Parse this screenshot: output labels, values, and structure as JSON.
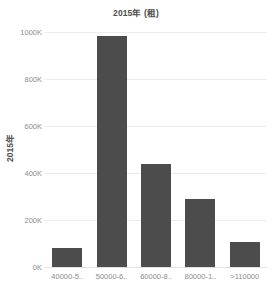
{
  "chart_data": {
    "type": "bar",
    "title": "2015年 (租)",
    "xlabel": "",
    "ylabel": "2015年",
    "categories": [
      "40000-5..",
      "50000-6..",
      "60000-8..",
      "80000-1..",
      ">110000"
    ],
    "values": [
      80000,
      985000,
      440000,
      288000,
      105000
    ],
    "ylim": [
      0,
      1000000
    ],
    "yticks": [
      0,
      200000,
      400000,
      600000,
      800000,
      1000000
    ],
    "ytick_labels": [
      "0K",
      "200K",
      "400K",
      "600K",
      "800K",
      "1000K"
    ],
    "grid": true,
    "legend": "none",
    "bar_color": "#4c4c4c",
    "grid_color": "#ededed",
    "text_color": "#8c8c8c",
    "title_color": "#4d4d4d"
  }
}
